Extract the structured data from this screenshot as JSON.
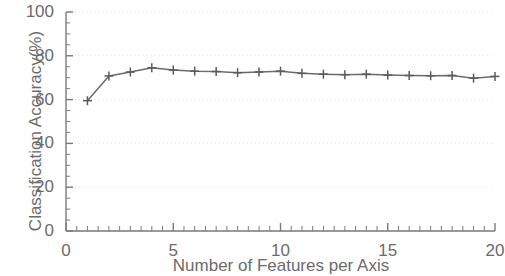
{
  "chart_data": {
    "type": "line",
    "title": "",
    "xlabel": "Number of Features per Axis",
    "ylabel": "Classification Accuracy(%)",
    "xlim": [
      0,
      20
    ],
    "ylim": [
      0,
      100
    ],
    "xticks": [
      0,
      5,
      10,
      15,
      20
    ],
    "yticks": [
      0,
      20,
      40,
      60,
      80,
      100
    ],
    "xtick_labels": [
      "0",
      "5",
      "10",
      "15",
      "20"
    ],
    "ytick_labels": [
      "0",
      "20",
      "40",
      "60",
      "80",
      "100"
    ],
    "minor_tick_interval_x": 0.5,
    "minor_tick_interval_y": 5,
    "grid": "dotted-major-horizontal",
    "legend": "none",
    "marker": "plus",
    "line_color": "#6b6b6b",
    "marker_color": "#5a5a5a",
    "grid_color": "#e2e2e2",
    "axis_color": "#7a7a7a",
    "x": [
      1,
      2,
      3,
      4,
      5,
      6,
      7,
      8,
      9,
      10,
      11,
      12,
      13,
      14,
      15,
      16,
      17,
      18,
      19,
      20
    ],
    "values": [
      59.5,
      70.8,
      72.6,
      74.5,
      73.5,
      73.0,
      72.8,
      72.3,
      72.6,
      73.0,
      72.0,
      71.6,
      71.4,
      71.6,
      71.2,
      71.0,
      70.9,
      71.0,
      69.8,
      70.6
    ],
    "series": [
      {
        "name": "Classification Accuracy",
        "values": [
          59.5,
          70.8,
          72.6,
          74.5,
          73.5,
          73.0,
          72.8,
          72.3,
          72.6,
          73.0,
          72.0,
          71.6,
          71.4,
          71.6,
          71.2,
          71.0,
          70.9,
          71.0,
          69.8,
          70.6
        ]
      }
    ]
  },
  "axes": {
    "x_title": "Number of Features per Axis",
    "y_title": "Classification Accuracy(%)"
  }
}
